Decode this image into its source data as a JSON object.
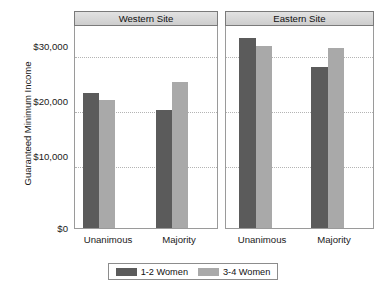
{
  "chart_data": {
    "type": "bar",
    "title": "",
    "xlabel": "",
    "ylabel": "Guaranteed Minimum Income",
    "ylim": [
      0,
      33000
    ],
    "grid": true,
    "legend_position": "bottom",
    "panels": [
      {
        "label": "Western Site"
      },
      {
        "label": "Eastern Site"
      }
    ],
    "categories": [
      "Unanimous",
      "Majority"
    ],
    "y_ticks": [
      {
        "value": 30000,
        "label": "$30,000"
      },
      {
        "value": 20000,
        "label": "$20,000"
      },
      {
        "value": 10000,
        "label": "$10,000"
      },
      {
        "value": 0,
        "label": "$0"
      }
    ],
    "series": [
      {
        "name": "1-2 Women",
        "color": "#5b5b5b"
      },
      {
        "name": "3-4 Women",
        "color": "#a9a9a9"
      }
    ],
    "values": {
      "Western Site": {
        "1-2 Women": [
          22450,
          19700
        ],
        "3-4 Women": [
          21300,
          24300
        ]
      },
      "Eastern Site": {
        "1-2 Women": [
          31500,
          26700
        ],
        "3-4 Women": [
          30100,
          29900
        ]
      }
    },
    "bars": [
      {
        "panel": "Western Site",
        "category": "Unanimous",
        "series": "1-2 Women",
        "value": 22450
      },
      {
        "panel": "Western Site",
        "category": "Unanimous",
        "series": "3-4 Women",
        "value": 21300
      },
      {
        "panel": "Western Site",
        "category": "Majority",
        "series": "1-2 Women",
        "value": 19700
      },
      {
        "panel": "Western Site",
        "category": "Majority",
        "series": "3-4 Women",
        "value": 24300
      },
      {
        "panel": "Eastern Site",
        "category": "Unanimous",
        "series": "1-2 Women",
        "value": 31500
      },
      {
        "panel": "Eastern Site",
        "category": "Unanimous",
        "series": "3-4 Women",
        "value": 30100
      },
      {
        "panel": "Eastern Site",
        "category": "Majority",
        "series": "1-2 Women",
        "value": 26700
      },
      {
        "panel": "Eastern Site",
        "category": "Majority",
        "series": "3-4 Women",
        "value": 29900
      }
    ]
  },
  "axis": {
    "y_title": "Guaranteed Minimum Income",
    "tick_30k": "$30,000",
    "tick_20k": "$20,000",
    "tick_10k": "$10,000",
    "tick_0": "$0"
  },
  "panels": {
    "west": {
      "header": "Western Site",
      "cat1": "Unanimous",
      "cat2": "Majority"
    },
    "east": {
      "header": "Eastern Site",
      "cat1": "Unanimous",
      "cat2": "Majority"
    }
  },
  "legend": {
    "series1": "1-2 Women",
    "series2": "3-4 Women"
  }
}
